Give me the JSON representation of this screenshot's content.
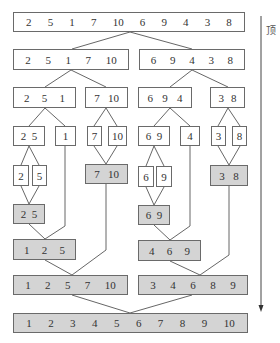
{
  "diagram": {
    "side_label": "顶",
    "arrow_direction": "down",
    "colors": {
      "split_box": "#ffffff",
      "merged_box": "#d4d4d4",
      "border": "#6a6a6a",
      "line": "#555555"
    },
    "boxes": [
      {
        "id": "r1",
        "values": [
          "2",
          "5",
          "1",
          "7",
          "10",
          "6",
          "9",
          "4",
          "3",
          "8"
        ],
        "x": 13,
        "y": 12,
        "w": 232,
        "h": 20,
        "merged": false
      },
      {
        "id": "r2a",
        "values": [
          "2",
          "5",
          "1",
          "7",
          "10"
        ],
        "x": 13,
        "y": 49,
        "w": 116,
        "h": 21,
        "merged": false
      },
      {
        "id": "r2b",
        "values": [
          "6",
          "9",
          "4",
          "3",
          "8"
        ],
        "x": 139,
        "y": 49,
        "w": 106,
        "h": 21,
        "merged": false
      },
      {
        "id": "r3a",
        "values": [
          "2",
          "5",
          "1"
        ],
        "x": 13,
        "y": 87,
        "w": 63,
        "h": 21,
        "merged": false
      },
      {
        "id": "r3b",
        "values": [
          "7",
          "10"
        ],
        "x": 85,
        "y": 87,
        "w": 43,
        "h": 21,
        "merged": false
      },
      {
        "id": "r3c",
        "values": [
          "6",
          "9",
          "4"
        ],
        "x": 138,
        "y": 87,
        "w": 54,
        "h": 21,
        "merged": false
      },
      {
        "id": "r3d",
        "values": [
          "3",
          "8"
        ],
        "x": 210,
        "y": 87,
        "w": 35,
        "h": 21,
        "merged": false
      },
      {
        "id": "r4a",
        "values": [
          "2",
          "5"
        ],
        "x": 13,
        "y": 126,
        "w": 32,
        "h": 20,
        "merged": false
      },
      {
        "id": "r4b",
        "values": [
          "1"
        ],
        "x": 55,
        "y": 126,
        "w": 21,
        "h": 20,
        "merged": false
      },
      {
        "id": "r4c",
        "values": [
          "7"
        ],
        "x": 87,
        "y": 126,
        "w": 15,
        "h": 20,
        "merged": false
      },
      {
        "id": "r4d",
        "values": [
          "10"
        ],
        "x": 108,
        "y": 126,
        "w": 19,
        "h": 20,
        "merged": false
      },
      {
        "id": "r4e",
        "values": [
          "6",
          "9"
        ],
        "x": 138,
        "y": 126,
        "w": 32,
        "h": 20,
        "merged": false
      },
      {
        "id": "r4f",
        "values": [
          "4"
        ],
        "x": 180,
        "y": 126,
        "w": 20,
        "h": 20,
        "merged": false
      },
      {
        "id": "r4g",
        "values": [
          "3"
        ],
        "x": 211,
        "y": 126,
        "w": 15,
        "h": 20,
        "merged": false
      },
      {
        "id": "r4h",
        "values": [
          "8"
        ],
        "x": 232,
        "y": 126,
        "w": 15,
        "h": 20,
        "merged": false
      },
      {
        "id": "r5a",
        "values": [
          "2"
        ],
        "x": 13,
        "y": 165,
        "w": 16,
        "h": 21,
        "merged": false
      },
      {
        "id": "r5b",
        "values": [
          "5"
        ],
        "x": 32,
        "y": 165,
        "w": 15,
        "h": 21,
        "merged": false
      },
      {
        "id": "r5c",
        "values": [
          "7",
          "10"
        ],
        "x": 85,
        "y": 164,
        "w": 43,
        "h": 20,
        "merged": true
      },
      {
        "id": "r5d",
        "values": [
          "6"
        ],
        "x": 138,
        "y": 166,
        "w": 16,
        "h": 21,
        "merged": false
      },
      {
        "id": "r5e",
        "values": [
          "9"
        ],
        "x": 156,
        "y": 166,
        "w": 16,
        "h": 21,
        "merged": false
      },
      {
        "id": "r5f",
        "values": [
          "3",
          "8"
        ],
        "x": 210,
        "y": 165,
        "w": 38,
        "h": 21,
        "merged": true
      },
      {
        "id": "r6a",
        "values": [
          "2",
          "5"
        ],
        "x": 13,
        "y": 204,
        "w": 32,
        "h": 20,
        "merged": true
      },
      {
        "id": "r6b",
        "values": [
          "6",
          "9"
        ],
        "x": 138,
        "y": 205,
        "w": 32,
        "h": 20,
        "merged": true
      },
      {
        "id": "r7a",
        "values": [
          "1",
          "2",
          "5"
        ],
        "x": 13,
        "y": 239,
        "w": 63,
        "h": 21,
        "merged": true
      },
      {
        "id": "r7b",
        "values": [
          "4",
          "6",
          "9"
        ],
        "x": 138,
        "y": 240,
        "w": 63,
        "h": 21,
        "merged": true
      },
      {
        "id": "r8a",
        "values": [
          "1",
          "2",
          "5",
          "7",
          "10"
        ],
        "x": 13,
        "y": 275,
        "w": 115,
        "h": 20,
        "merged": true
      },
      {
        "id": "r8b",
        "values": [
          "3",
          "4",
          "6",
          "8",
          "9"
        ],
        "x": 138,
        "y": 275,
        "w": 110,
        "h": 20,
        "merged": true
      },
      {
        "id": "r9",
        "values": [
          "1",
          "2",
          "3",
          "4",
          "5",
          "6",
          "7",
          "8",
          "9",
          "10"
        ],
        "x": 13,
        "y": 313,
        "w": 235,
        "h": 20,
        "merged": true
      }
    ],
    "lines": [
      [
        130,
        32,
        72,
        49
      ],
      [
        130,
        32,
        192,
        49
      ],
      [
        71,
        70,
        45,
        87
      ],
      [
        71,
        70,
        106,
        87
      ],
      [
        192,
        70,
        170,
        87
      ],
      [
        192,
        70,
        228,
        87
      ],
      [
        45,
        108,
        29,
        126
      ],
      [
        45,
        108,
        65,
        126
      ],
      [
        106,
        108,
        94,
        126
      ],
      [
        106,
        108,
        117,
        126
      ],
      [
        170,
        108,
        154,
        126
      ],
      [
        170,
        108,
        190,
        126
      ],
      [
        228,
        108,
        218,
        126
      ],
      [
        228,
        108,
        240,
        126
      ],
      [
        29,
        146,
        21,
        165
      ],
      [
        29,
        146,
        39,
        165
      ],
      [
        94,
        146,
        106,
        164
      ],
      [
        117,
        146,
        106,
        164
      ],
      [
        154,
        146,
        146,
        166
      ],
      [
        154,
        146,
        164,
        166
      ],
      [
        218,
        146,
        229,
        165
      ],
      [
        240,
        146,
        229,
        165
      ],
      [
        21,
        186,
        29,
        204
      ],
      [
        39,
        186,
        29,
        204
      ],
      [
        146,
        187,
        154,
        205
      ],
      [
        164,
        187,
        154,
        205
      ],
      [
        29,
        224,
        45,
        239
      ],
      [
        65,
        146,
        65,
        226
      ],
      [
        65,
        226,
        45,
        239
      ],
      [
        154,
        225,
        170,
        240
      ],
      [
        190,
        146,
        190,
        226
      ],
      [
        190,
        226,
        170,
        240
      ],
      [
        45,
        260,
        72,
        275
      ],
      [
        106,
        184,
        106,
        250
      ],
      [
        106,
        250,
        72,
        275
      ],
      [
        170,
        261,
        200,
        275
      ],
      [
        229,
        186,
        229,
        255
      ],
      [
        229,
        255,
        200,
        275
      ],
      [
        72,
        295,
        130,
        313
      ],
      [
        192,
        295,
        130,
        313
      ]
    ],
    "arrow": {
      "x": 261,
      "y1": 16,
      "y2": 312
    }
  }
}
